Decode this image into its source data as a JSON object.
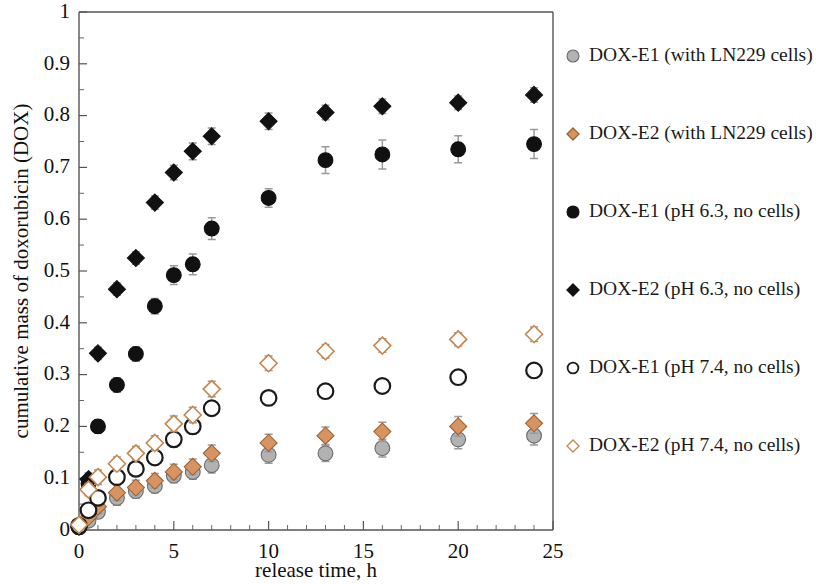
{
  "chart_data": {
    "type": "scatter",
    "title": "",
    "xlabel": "release time, h",
    "ylabel": "cumulative mass of doxorubicin (DOX)",
    "xlim": [
      0,
      25
    ],
    "ylim": [
      0,
      1
    ],
    "xticks": [
      0,
      5,
      10,
      15,
      20,
      25
    ],
    "xtick_labels": [
      "0",
      "5",
      "10",
      "15",
      "20",
      "25"
    ],
    "xtick_minor_step": 1,
    "yticks": [
      0,
      0.1,
      0.2,
      0.3,
      0.4,
      0.5,
      0.6,
      0.7,
      0.8,
      0.9,
      1
    ],
    "ytick_labels": [
      "0",
      "0.1",
      "0.2",
      "0.3",
      "0.4",
      "0.5",
      "0.6",
      "0.7",
      "0.8",
      "0.9",
      "1"
    ],
    "grid": false,
    "legend_position": "right",
    "error_bars": true,
    "series": [
      {
        "name": "DOX-E1 (with LN229 cells)",
        "marker": "filled-circle",
        "color": "#b2b2b2",
        "edge_color": "#6b6b6b",
        "x": [
          0,
          0.5,
          1,
          2,
          3,
          4,
          5,
          6,
          7,
          10,
          13,
          16,
          20,
          24
        ],
        "y": [
          0.005,
          0.018,
          0.035,
          0.062,
          0.075,
          0.085,
          0.105,
          0.112,
          0.125,
          0.145,
          0.148,
          0.158,
          0.175,
          0.182
        ],
        "yerr": [
          0.004,
          0.008,
          0.012,
          0.014,
          0.013,
          0.013,
          0.014,
          0.014,
          0.015,
          0.016,
          0.016,
          0.017,
          0.018,
          0.018
        ]
      },
      {
        "name": "DOX-E2 (with LN229 cells)",
        "marker": "filled-diamond",
        "color": "#d89360",
        "edge_color": "#9c6336",
        "x": [
          0,
          0.5,
          1,
          2,
          3,
          4,
          5,
          6,
          7,
          10,
          13,
          16,
          20,
          24
        ],
        "y": [
          0.006,
          0.025,
          0.045,
          0.072,
          0.082,
          0.095,
          0.112,
          0.122,
          0.148,
          0.168,
          0.182,
          0.19,
          0.2,
          0.206
        ],
        "yerr": [
          0.005,
          0.009,
          0.013,
          0.015,
          0.014,
          0.014,
          0.015,
          0.015,
          0.016,
          0.017,
          0.017,
          0.018,
          0.019,
          0.019
        ]
      },
      {
        "name": "DOX-E1 (pH 6.3, no cells)",
        "marker": "filled-circle",
        "color": "#111111",
        "edge_color": "#111111",
        "x": [
          0,
          0.5,
          1,
          2,
          3,
          4,
          5,
          6,
          7,
          10,
          13,
          16,
          20,
          24
        ],
        "y": [
          0.005,
          0.09,
          0.2,
          0.28,
          0.34,
          0.432,
          0.492,
          0.513,
          0.582,
          0.641,
          0.714,
          0.725,
          0.735,
          0.745
        ],
        "yerr": [
          0.004,
          0.01,
          0.013,
          0.014,
          0.014,
          0.015,
          0.018,
          0.02,
          0.021,
          0.018,
          0.026,
          0.028,
          0.026,
          0.028
        ]
      },
      {
        "name": "DOX-E2 (pH 6.3, no cells)",
        "marker": "filled-diamond",
        "color": "#111111",
        "edge_color": "#111111",
        "x": [
          0,
          0.5,
          1,
          2,
          3,
          4,
          5,
          6,
          7,
          10,
          13,
          16,
          20,
          24
        ],
        "y": [
          0.008,
          0.098,
          0.341,
          0.465,
          0.525,
          0.632,
          0.69,
          0.731,
          0.76,
          0.789,
          0.806,
          0.818,
          0.825,
          0.84
        ],
        "yerr": [
          0.005,
          0.012,
          0.012,
          0.012,
          0.012,
          0.013,
          0.014,
          0.016,
          0.016,
          0.016,
          0.014,
          0.014,
          0.013,
          0.014
        ]
      },
      {
        "name": "DOX-E1 (pH 7.4, no cells)",
        "marker": "open-circle",
        "color": "#ffffff",
        "edge_color": "#1a1a1a",
        "x": [
          0,
          0.5,
          1,
          2,
          3,
          4,
          5,
          6,
          7,
          10,
          13,
          16,
          20,
          24
        ],
        "y": [
          0.008,
          0.038,
          0.062,
          0.102,
          0.118,
          0.14,
          0.175,
          0.2,
          0.235,
          0.255,
          0.268,
          0.278,
          0.295,
          0.308
        ],
        "yerr": [
          0.005,
          0.012,
          0.014,
          0.013,
          0.013,
          0.014,
          0.015,
          0.014,
          0.014,
          0.012,
          0.012,
          0.012,
          0.012,
          0.012
        ]
      },
      {
        "name": "DOX-E2 (pH 7.4, no cells)",
        "marker": "open-diamond",
        "color": "#ffffff",
        "edge_color": "#c4874f",
        "x": [
          0,
          0.5,
          1,
          2,
          3,
          4,
          5,
          6,
          7,
          10,
          13,
          16,
          20,
          24
        ],
        "y": [
          0.01,
          0.078,
          0.102,
          0.128,
          0.148,
          0.168,
          0.205,
          0.222,
          0.272,
          0.322,
          0.345,
          0.356,
          0.368,
          0.378
        ],
        "yerr": [
          0.005,
          0.012,
          0.014,
          0.013,
          0.013,
          0.014,
          0.015,
          0.015,
          0.015,
          0.014,
          0.013,
          0.013,
          0.013,
          0.014
        ]
      }
    ]
  },
  "legend": {
    "entries": [
      {
        "label": "DOX-E1 (with LN229 cells)",
        "marker": "filled-circle",
        "color": "#b2b2b2",
        "edge_color": "#6b6b6b"
      },
      {
        "label": "DOX-E2 (with LN229 cells)",
        "marker": "filled-diamond",
        "color": "#d89360",
        "edge_color": "#9c6336"
      },
      {
        "label": "DOX-E1 (pH 6.3, no cells)",
        "marker": "filled-circle",
        "color": "#111111",
        "edge_color": "#111111"
      },
      {
        "label": "DOX-E2 (pH 6.3, no cells)",
        "marker": "filled-diamond",
        "color": "#111111",
        "edge_color": "#111111"
      },
      {
        "label": "DOX-E1 (pH 7.4, no cells)",
        "marker": "open-circle",
        "color": "#ffffff",
        "edge_color": "#1a1a1a"
      },
      {
        "label": "DOX-E2 (pH 7.4, no cells)",
        "marker": "open-diamond",
        "color": "#ffffff",
        "edge_color": "#c4874f"
      }
    ]
  }
}
